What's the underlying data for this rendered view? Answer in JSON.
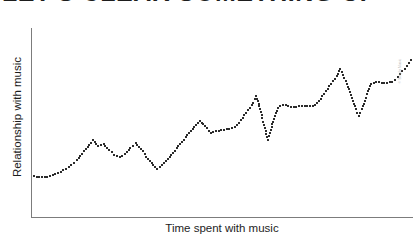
{
  "figure": {
    "width": 413,
    "height": 238,
    "background": "#ffffff",
    "ink_color": "#2b2b2b",
    "axis_color": "#7c7c7c",
    "watermark_color": "#b4b4b4"
  },
  "title": {
    "text": "LET'S CLEAR SOMETHING UP",
    "note": "cropped off by top edge of screenshot; only lower pixel row of glyphs visible"
  },
  "watermark": {
    "text": "© Simply Music"
  },
  "chart_data": {
    "type": "scatter",
    "title": "LET'S CLEAR SOMETHING UP",
    "subtitle": "",
    "xlabel": "Time spent with music",
    "ylabel": "Relationship with music",
    "grid": false,
    "legend": false,
    "tick_labels": {
      "x": [],
      "y": []
    },
    "axis_style": "arrowless L-frame, unlabeled qualitative axes",
    "xlim": [
      0,
      100
    ],
    "ylim": [
      0,
      100
    ],
    "marker": {
      "shape": "square",
      "size_px": 2,
      "color": "#2b2b2b"
    },
    "points": [
      [
        0.8,
        21.5
      ],
      [
        2.2,
        21.0
      ],
      [
        3.6,
        21.0
      ],
      [
        5.0,
        21.5
      ],
      [
        6.4,
        22.5
      ],
      [
        7.8,
        24.0
      ],
      [
        9.2,
        25.5
      ],
      [
        10.6,
        27.5
      ],
      [
        12.0,
        30.0
      ],
      [
        13.4,
        33.5
      ],
      [
        14.8,
        37.0
      ],
      [
        16.2,
        40.5
      ],
      [
        17.6,
        37.5
      ],
      [
        19.0,
        38.5
      ],
      [
        20.4,
        35.5
      ],
      [
        21.8,
        33.0
      ],
      [
        23.2,
        31.5
      ],
      [
        24.6,
        33.5
      ],
      [
        26.0,
        36.5
      ],
      [
        27.4,
        39.0
      ],
      [
        28.8,
        36.0
      ],
      [
        30.2,
        32.0
      ],
      [
        31.6,
        28.5
      ],
      [
        33.0,
        25.5
      ],
      [
        34.4,
        27.5
      ],
      [
        35.8,
        30.5
      ],
      [
        37.2,
        34.0
      ],
      [
        38.6,
        37.5
      ],
      [
        40.0,
        41.0
      ],
      [
        41.4,
        44.5
      ],
      [
        42.8,
        47.5
      ],
      [
        44.2,
        51.0
      ],
      [
        45.6,
        48.0
      ],
      [
        47.0,
        44.5
      ],
      [
        48.4,
        45.5
      ],
      [
        49.8,
        46.0
      ],
      [
        51.2,
        46.5
      ],
      [
        52.6,
        47.0
      ],
      [
        54.0,
        48.5
      ],
      [
        55.4,
        52.5
      ],
      [
        56.8,
        56.5
      ],
      [
        58.2,
        60.5
      ],
      [
        59.0,
        64.0
      ],
      [
        59.6,
        60.0
      ],
      [
        60.2,
        55.5
      ],
      [
        60.8,
        50.5
      ],
      [
        61.4,
        45.5
      ],
      [
        62.0,
        41.0
      ],
      [
        62.6,
        44.5
      ],
      [
        63.2,
        49.0
      ],
      [
        63.8,
        53.5
      ],
      [
        64.6,
        57.5
      ],
      [
        66.0,
        59.5
      ],
      [
        67.4,
        58.5
      ],
      [
        68.8,
        58.0
      ],
      [
        70.2,
        58.5
      ],
      [
        71.6,
        58.5
      ],
      [
        73.0,
        58.5
      ],
      [
        74.4,
        59.0
      ],
      [
        75.8,
        62.5
      ],
      [
        77.2,
        66.5
      ],
      [
        78.6,
        70.5
      ],
      [
        80.0,
        74.5
      ],
      [
        81.0,
        78.5
      ],
      [
        81.8,
        75.0
      ],
      [
        82.6,
        70.5
      ],
      [
        83.4,
        66.0
      ],
      [
        84.2,
        61.5
      ],
      [
        85.0,
        57.0
      ],
      [
        85.8,
        53.5
      ],
      [
        86.6,
        57.0
      ],
      [
        87.4,
        61.5
      ],
      [
        88.2,
        66.5
      ],
      [
        89.0,
        70.5
      ],
      [
        90.4,
        71.5
      ],
      [
        91.8,
        71.0
      ],
      [
        93.2,
        71.0
      ],
      [
        94.6,
        71.5
      ],
      [
        96.0,
        74.0
      ],
      [
        97.2,
        77.0
      ],
      [
        98.4,
        80.0
      ],
      [
        99.4,
        83.0
      ]
    ]
  },
  "axes": {
    "y_label": "Relationship with music",
    "x_label": "Time spent with music"
  }
}
